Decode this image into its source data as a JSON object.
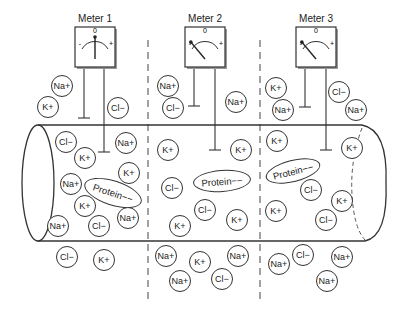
{
  "meters": [
    {
      "label": "Meter 1",
      "x": 95,
      "needle_angle": 0
    },
    {
      "label": "Meter 2",
      "x": 205,
      "needle_angle": -40
    },
    {
      "label": "Meter 3",
      "x": 316,
      "needle_angle": -40
    }
  ],
  "meter_scale": {
    "minus": "-",
    "zero": "0",
    "plus": "+"
  },
  "ions": [
    {
      "t": "Na+",
      "x": 62,
      "y": 86
    },
    {
      "t": "K+",
      "x": 48,
      "y": 107
    },
    {
      "t": "Cl−",
      "x": 118,
      "y": 108
    },
    {
      "t": "Cl−",
      "x": 66,
      "y": 142
    },
    {
      "t": "Na+",
      "x": 126,
      "y": 143
    },
    {
      "t": "K+",
      "x": 85,
      "y": 158
    },
    {
      "t": "K+",
      "x": 129,
      "y": 173
    },
    {
      "t": "Na+",
      "x": 71,
      "y": 184
    },
    {
      "t": "K+",
      "x": 85,
      "y": 206
    },
    {
      "t": "Na+",
      "x": 58,
      "y": 226
    },
    {
      "t": "Cl−",
      "x": 99,
      "y": 226
    },
    {
      "t": "Na+",
      "x": 128,
      "y": 218
    },
    {
      "t": "Cl−",
      "x": 67,
      "y": 257
    },
    {
      "t": "K+",
      "x": 104,
      "y": 260
    },
    {
      "t": "Na+",
      "x": 168,
      "y": 86
    },
    {
      "t": "Cl−",
      "x": 173,
      "y": 108
    },
    {
      "t": "Na+",
      "x": 236,
      "y": 102
    },
    {
      "t": "K+",
      "x": 168,
      "y": 150
    },
    {
      "t": "K+",
      "x": 241,
      "y": 150
    },
    {
      "t": "Cl−",
      "x": 172,
      "y": 188
    },
    {
      "t": "Cl−",
      "x": 205,
      "y": 210
    },
    {
      "t": "K+",
      "x": 180,
      "y": 226
    },
    {
      "t": "K+",
      "x": 237,
      "y": 220
    },
    {
      "t": "Na+",
      "x": 166,
      "y": 256
    },
    {
      "t": "K+",
      "x": 200,
      "y": 262
    },
    {
      "t": "Na+",
      "x": 238,
      "y": 256
    },
    {
      "t": "Na+",
      "x": 180,
      "y": 281
    },
    {
      "t": "Cl−",
      "x": 222,
      "y": 279
    },
    {
      "t": "K+",
      "x": 276,
      "y": 88
    },
    {
      "t": "Na+",
      "x": 283,
      "y": 110
    },
    {
      "t": "Cl−",
      "x": 339,
      "y": 92
    },
    {
      "t": "Na+",
      "x": 356,
      "y": 110
    },
    {
      "t": "K+",
      "x": 277,
      "y": 141
    },
    {
      "t": "K+",
      "x": 352,
      "y": 148
    },
    {
      "t": "Cl−",
      "x": 311,
      "y": 190
    },
    {
      "t": "K+",
      "x": 342,
      "y": 201
    },
    {
      "t": "K+",
      "x": 276,
      "y": 211
    },
    {
      "t": "Cl−",
      "x": 326,
      "y": 220
    },
    {
      "t": "Na+",
      "x": 279,
      "y": 264
    },
    {
      "t": "Cl−",
      "x": 303,
      "y": 255
    },
    {
      "t": "Na+",
      "x": 342,
      "y": 257
    },
    {
      "t": "Na+",
      "x": 327,
      "y": 281
    }
  ],
  "proteins": [
    {
      "t": "Protein−−",
      "x": 113,
      "y": 193,
      "w": 60,
      "h": 25,
      "rot": "18deg"
    },
    {
      "t": "Protein−−",
      "x": 222,
      "y": 181,
      "w": 58,
      "h": 22,
      "rot": "-4deg"
    },
    {
      "t": "Protein−−",
      "x": 293,
      "y": 171,
      "w": 56,
      "h": 22,
      "rot": "-14deg"
    }
  ]
}
